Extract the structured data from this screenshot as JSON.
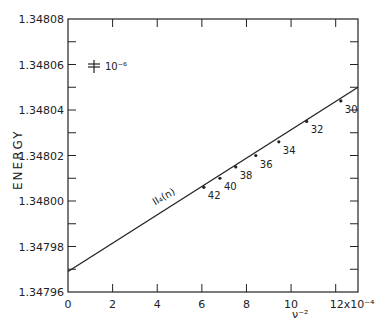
{
  "chart_data": {
    "type": "line",
    "title": "",
    "xlabel": "ν⁻²",
    "xlabel_scale": "×10⁻⁴",
    "ylabel": "ENERGY",
    "xlim": [
      0,
      13
    ],
    "ylim": [
      1.34796,
      1.34808
    ],
    "x_ticks": [
      0,
      2,
      4,
      6,
      8,
      10,
      12
    ],
    "x_tick_labels": [
      "0",
      "2",
      "4",
      "6",
      "8",
      "10",
      "12x10⁻⁴"
    ],
    "y_ticks": [
      1.34796,
      1.34798,
      1.348,
      1.34802,
      1.34804,
      1.34806,
      1.34808
    ],
    "y_tick_labels": [
      "1.34796",
      "1.34798",
      "1.34800",
      "1.34802",
      "1.34804",
      "1.34806",
      "1.34808"
    ],
    "y_minor_step": 1e-05,
    "grid": false,
    "legend": null,
    "error_bar_annotation": "10⁻⁶",
    "series": [
      {
        "name": "II₄(n)",
        "kind": "fit-line",
        "x": [
          0,
          13
        ],
        "y": [
          1.347969,
          1.34805
        ]
      },
      {
        "name": "II₄(n) data",
        "kind": "points",
        "labels": [
          "42",
          "40",
          "38",
          "36",
          "34",
          "32",
          "30"
        ],
        "x": [
          6.09,
          6.81,
          7.52,
          8.42,
          9.45,
          10.7,
          12.23
        ],
        "y": [
          1.348006,
          1.34801,
          1.348015,
          1.34802,
          1.348026,
          1.348035,
          1.348044
        ]
      }
    ],
    "annotations": [
      {
        "text": "II₄(n)",
        "x": 3.9,
        "y": 1.347998,
        "rotation": -30
      }
    ]
  }
}
